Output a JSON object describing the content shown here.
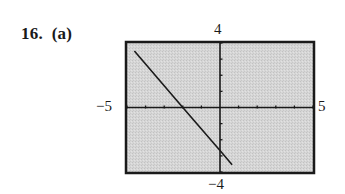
{
  "problem": {
    "number_label": "16.  (a)"
  },
  "chart_data": {
    "type": "line",
    "title": "",
    "xlabel": "",
    "ylabel": "",
    "xlim": [
      -5,
      5
    ],
    "ylim": [
      -4,
      4
    ],
    "xtick_spacing": 1,
    "ytick_spacing": 1,
    "grid": false,
    "window_labels": {
      "xmin": "−5",
      "xmax": "5",
      "ymin": "−4",
      "ymax": "4"
    },
    "series": [
      {
        "name": "line",
        "equation_estimate": "y = -1.33x - 2.67",
        "x": [
          -4.6,
          -2,
          0,
          0.65
        ],
        "y": [
          3.5,
          0,
          -2.67,
          -3.55
        ]
      }
    ],
    "intercepts_estimate": {
      "x_intercept": -2,
      "y_intercept": -2.67
    },
    "colors": {
      "background": "#d4d4d4",
      "frame": "#1a1a1a",
      "axes": "#1a1a1a",
      "line": "#1a1a1a"
    }
  }
}
